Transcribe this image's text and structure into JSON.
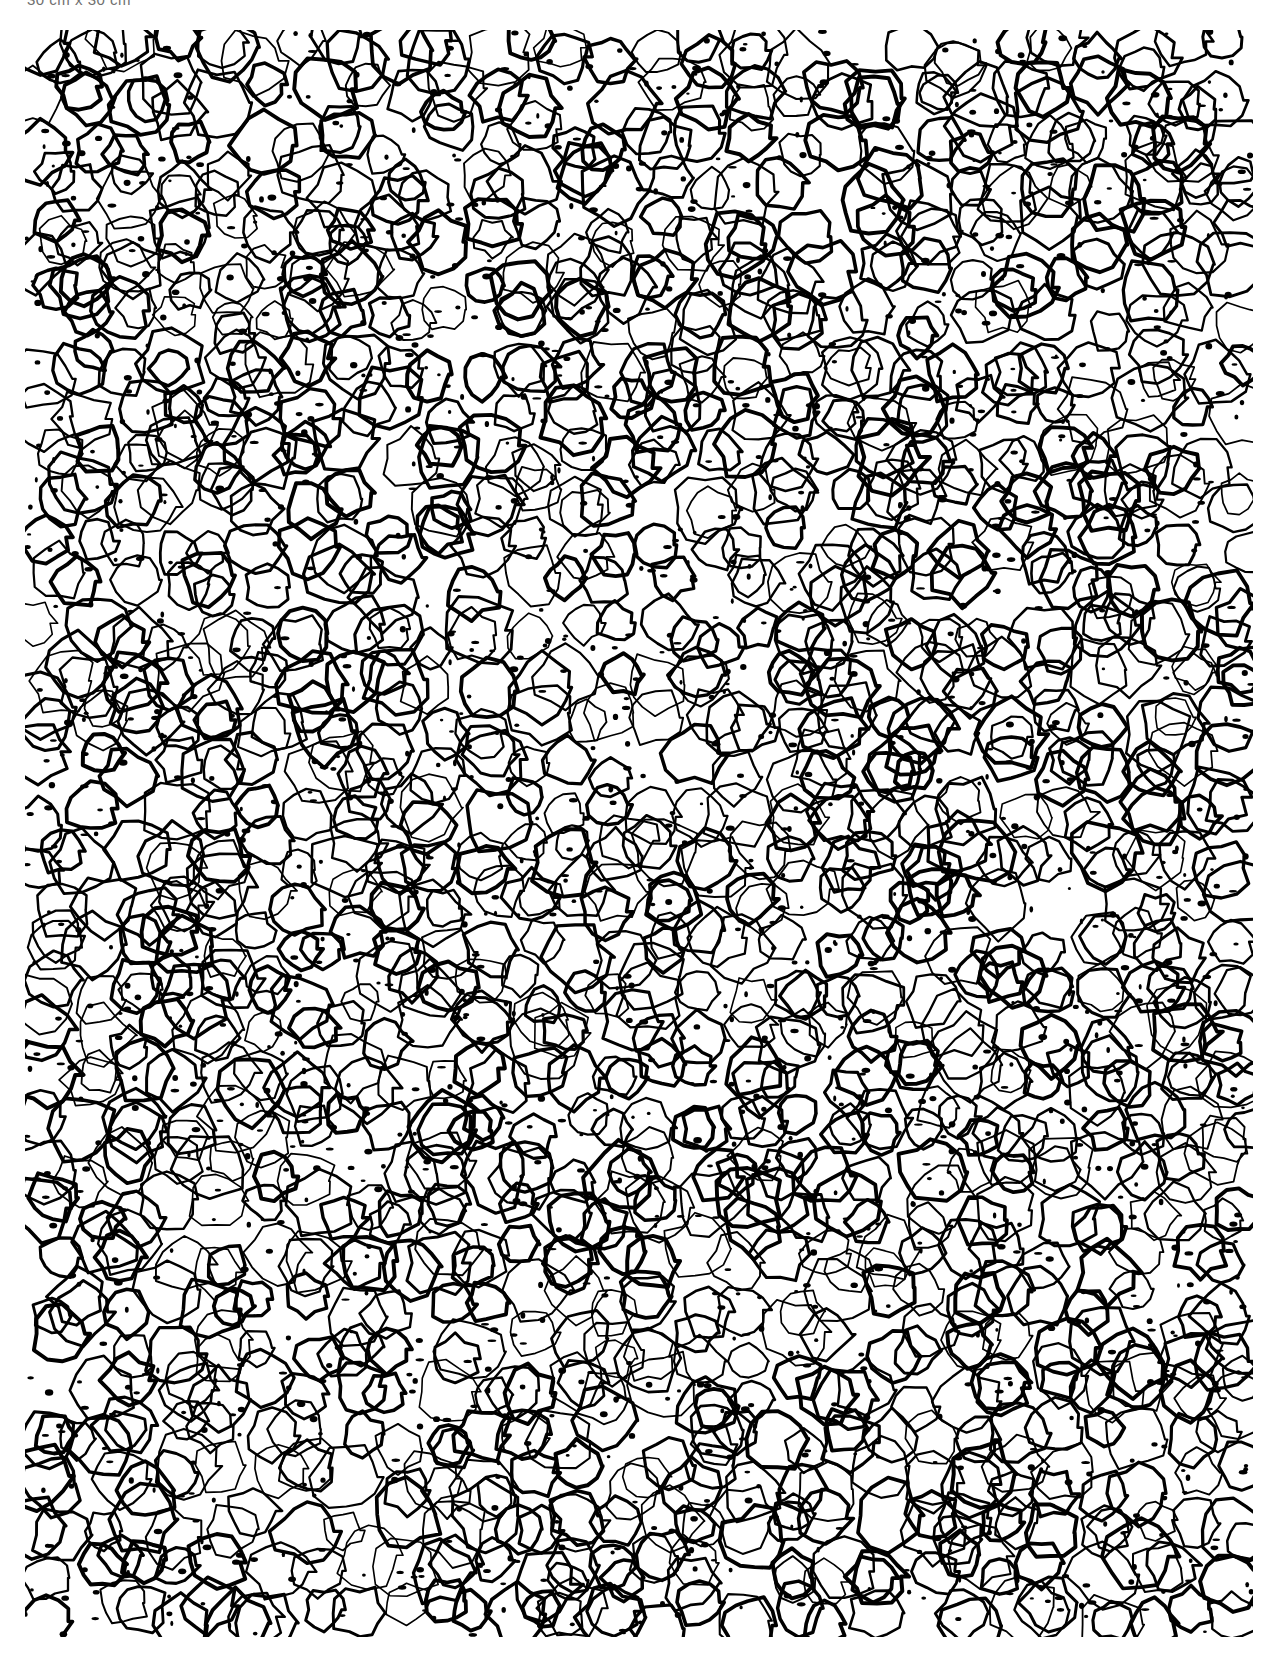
{
  "image": {
    "scale_label": "30 cm x 30 cm",
    "description": "High-contrast binary texture of irregular closed cell outlines (foam / cellular pattern)",
    "ink_color": "#000000",
    "background_color": "#ffffff",
    "label_color": "#6f6f6f",
    "texture_region": {
      "x": 25,
      "y": 30,
      "width": 1228,
      "height": 1607
    },
    "cell_grid": {
      "cols": 28,
      "rows": 36,
      "seed": 7
    }
  }
}
